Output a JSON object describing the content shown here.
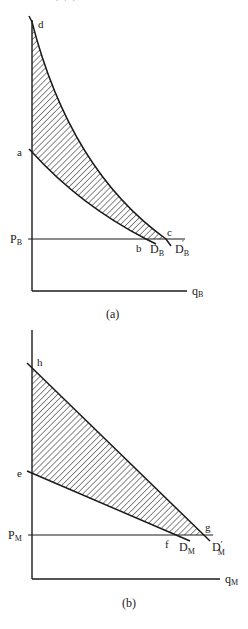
{
  "header_fragment": "· · ·",
  "colors": {
    "ink": "#1a1a1a",
    "hatch": "#2a2a2a",
    "background": "#ffffff"
  },
  "panel_a": {
    "caption": "(a)",
    "x_axis_label": "q",
    "x_axis_sub": "B",
    "price_label": "P",
    "price_sub": "B",
    "points": {
      "d": "d",
      "a": "a",
      "b": "b",
      "c": "c"
    },
    "curves": {
      "lower": {
        "name": "D",
        "sub": "B",
        "prime": ""
      },
      "upper": {
        "name": "D",
        "sub": "B",
        "prime": "′"
      }
    }
  },
  "panel_b": {
    "caption": "(b)",
    "x_axis_label": "q",
    "x_axis_sub": "M",
    "price_label": "P",
    "price_sub": "M",
    "points": {
      "h": "h",
      "e": "e",
      "f": "f",
      "g": "g"
    },
    "curves": {
      "lower": {
        "name": "D",
        "sub": "M",
        "prime": ""
      },
      "upper": {
        "name": "D",
        "sub": "M",
        "prime": "′"
      }
    }
  }
}
